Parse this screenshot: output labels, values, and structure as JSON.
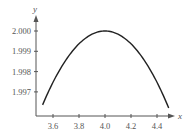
{
  "chart_data": {
    "type": "line",
    "title": "",
    "xlabel": "x",
    "ylabel": "y",
    "xlim": [
      3.5,
      4.5
    ],
    "ylim": [
      1.996,
      2.0
    ],
    "grid": false,
    "legend": null,
    "x_ticks": [
      "3.6",
      "3.8",
      "4.0",
      "4.2",
      "4.4"
    ],
    "y_ticks": [
      "1.997",
      "1.998",
      "1.999",
      "2.000"
    ],
    "series": [
      {
        "name": "curve",
        "x": [
          3.52,
          3.6,
          3.7,
          3.8,
          3.9,
          4.0,
          4.1,
          4.2,
          4.3,
          4.4,
          4.5
        ],
        "y": [
          1.9962,
          1.9974,
          1.9985,
          1.9993,
          1.9998,
          2.0,
          1.9998,
          1.9993,
          1.9985,
          1.9974,
          1.9961
        ]
      }
    ],
    "colors": {
      "axis": "#555555",
      "curve": "#222222"
    }
  }
}
